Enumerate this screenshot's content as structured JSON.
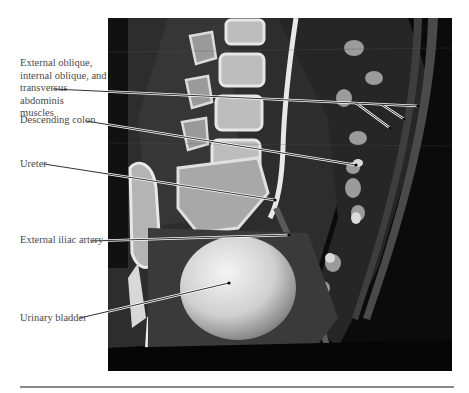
{
  "figure": {
    "type": "CT sagittal/parasagittal reconstruction of abdomen and pelvis",
    "labels": [
      {
        "id": "muscles",
        "text": "External oblique, internal oblique, and transversus abdominis muscles"
      },
      {
        "id": "descending-colon",
        "text": "Descending colon"
      },
      {
        "id": "ureter",
        "text": "Ureter"
      },
      {
        "id": "external-iliac-artery",
        "text": "External iliac artery"
      },
      {
        "id": "urinary-bladder",
        "text": "Urinary bladder"
      }
    ],
    "label_lines": {
      "muscles_line1": "External oblique,",
      "muscles_line2": "internal oblique, and",
      "muscles_line3": "transversus abdominis",
      "muscles_line4": "muscles"
    }
  },
  "colors": {
    "background": "#ffffff",
    "label_text": "#4a4a4a",
    "leader_line": "#1a1a1a",
    "leader_halo": "#ffffff",
    "rule": "#8a8a8a",
    "scan_background": "#0c0c0c"
  }
}
